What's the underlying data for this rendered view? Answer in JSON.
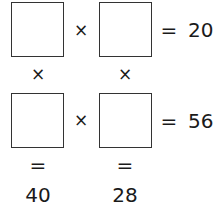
{
  "puzzle": {
    "row1": {
      "op": "×",
      "eq": "=",
      "result": "20"
    },
    "row2": {
      "op": "×",
      "eq": "=",
      "result": "56"
    },
    "col1": {
      "op": "×",
      "eq": "=",
      "result": "40"
    },
    "col2": {
      "op": "×",
      "eq": "=",
      "result": "28"
    },
    "cells": [
      "",
      "",
      "",
      ""
    ]
  }
}
